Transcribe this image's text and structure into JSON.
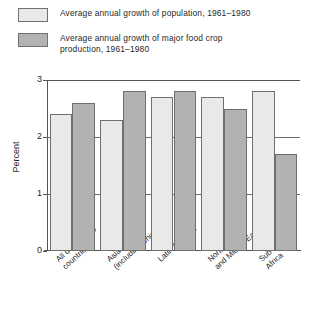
{
  "legend": {
    "items": [
      {
        "swatch": "light",
        "label": "Average annual growth of population, 1961–1980"
      },
      {
        "swatch": "dark",
        "label": "Average annual growth of major food crop\nproduction, 1961–1980"
      }
    ]
  },
  "colors": {
    "population_bar": "#e9e9e9",
    "food_crop_bar": "#b2b2b2",
    "bar_border": "#6f6f6f",
    "axis": "#555555"
  },
  "chart_data": {
    "type": "bar",
    "title": "",
    "xlabel": "",
    "ylabel": "Percent",
    "ylim": [
      0,
      3
    ],
    "yticks": [
      "0",
      "1",
      "2",
      "3"
    ],
    "grid": true,
    "legend_position": "top",
    "categories": [
      "All developing\ncountries",
      "Asia\n(including China)",
      "Latin America",
      "North Africa\nand Middle East",
      "Sub-Saharan\nAfrica"
    ],
    "series": [
      {
        "name": "Average annual growth of population, 1961–1980",
        "values": [
          2.4,
          2.3,
          2.7,
          2.7,
          2.8
        ]
      },
      {
        "name": "Average annual growth of major food crop production, 1961–1980",
        "values": [
          2.6,
          2.8,
          2.8,
          2.5,
          1.7
        ]
      }
    ]
  }
}
